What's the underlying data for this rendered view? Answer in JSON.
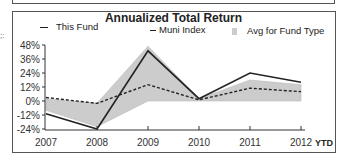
{
  "chart_data": {
    "type": "line",
    "title": "Annualized Total Return",
    "xlabel": "",
    "ylabel": "",
    "categories": [
      "2007",
      "2008",
      "2009",
      "2010",
      "2011",
      "2012"
    ],
    "x_suffix_label": "YTD",
    "ylim": [
      -24,
      48
    ],
    "yticks": [
      "48%",
      "36%",
      "24%",
      "12%",
      "0%",
      "-12%",
      "-24%"
    ],
    "grid": false,
    "legend_position": "top",
    "series": [
      {
        "name": "This Fund",
        "style": "solid",
        "color": "#222222",
        "values": [
          -11,
          -24,
          43,
          2,
          24,
          16
        ]
      },
      {
        "name": "Muni Index",
        "style": "dashed",
        "color": "#222222",
        "values": [
          3,
          -2,
          14,
          1,
          11,
          8
        ]
      },
      {
        "name": "Avg for Fund Type",
        "style": "area",
        "color": "#cccccc",
        "upper": [
          2,
          -2,
          47,
          2,
          18,
          14
        ],
        "lower": [
          -8,
          -22,
          0,
          0,
          0,
          0
        ]
      }
    ]
  },
  "legend": {
    "fund": "This Fund",
    "index": "Muni Index",
    "avg": "Avg for Fund Type"
  },
  "edge_fragment": ";:"
}
